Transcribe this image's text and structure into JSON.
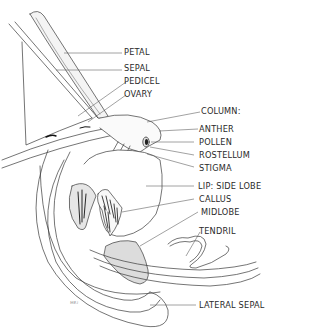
{
  "labels": {
    "petal": "PETAL",
    "sepal": "SEPAL",
    "pedicel": "PEDICEL",
    "ovary": "OVARY",
    "column": "COLUMN:",
    "anther": "ANTHER",
    "pollen": "POLLEN",
    "rostellum": "ROSTELLUM",
    "stigma": "STIGMA",
    "lip_side_lobe": "LIP:  SIDE  LOBE",
    "callus": "CALLUS",
    "midlobe": "MIDLOBE",
    "tendril": "TENDRIL",
    "lateral_sepal": "LATERAL  SEPAL"
  },
  "signature": "ᴍᴇᴊ",
  "colors": {
    "line": "#3a3a3a",
    "leader": "#555555",
    "shade": "#d8d8d8",
    "text": "#2a2a2a"
  }
}
